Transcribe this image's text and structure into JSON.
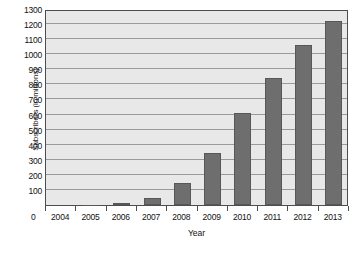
{
  "chart_data": {
    "type": "bar",
    "title": "",
    "xlabel": "Year",
    "ylabel": "Subscribers (in millions)",
    "categories": [
      "2004",
      "2005",
      "2006",
      "2007",
      "2008",
      "2009",
      "2010",
      "2011",
      "2012",
      "2013"
    ],
    "values": [
      0,
      3,
      8,
      45,
      148,
      347,
      607,
      845,
      1060,
      1222
    ],
    "series": [
      {
        "name": "Subscribers",
        "values": [
          0,
          3,
          8,
          45,
          148,
          347,
          607,
          845,
          1060,
          1222
        ]
      }
    ],
    "ylim": [
      0,
      1300
    ],
    "ytick_labels": [
      "0",
      "100",
      "200",
      "300",
      "400",
      "500",
      "600",
      "700",
      "800",
      "900",
      "1000",
      "1100",
      "1200",
      "1300"
    ],
    "ytick_values": [
      0,
      100,
      200,
      300,
      400,
      500,
      600,
      700,
      800,
      900,
      1000,
      1100,
      1200,
      1300
    ],
    "ytick_step": 100,
    "grid": true,
    "grid_axis": "y",
    "legend": false,
    "legend_position": "none",
    "zero_label": "0",
    "bar_color": "#6e6e6e",
    "bar_edge_color": "#575757",
    "plot_background": "#e8e8e8",
    "gridline_color": "#9a9a9a",
    "axis_color": "#4d4d4d",
    "text_color": "#111111"
  }
}
